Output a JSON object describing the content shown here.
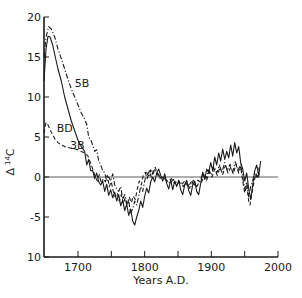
{
  "chart_data": {
    "type": "line",
    "title": "",
    "xlabel": "Years A.D.",
    "ylabel": "Δ 14C",
    "ylabel_parts": {
      "delta": "Δ",
      "mass": "14",
      "element": "C"
    },
    "xlim": [
      1649,
      2000
    ],
    "ylim": [
      -10,
      20
    ],
    "x_ticks": [
      1700,
      1800,
      1900,
      2000
    ],
    "x_minor_ticks": [
      1750,
      1850,
      1950
    ],
    "y_ticks": [
      20,
      15,
      10,
      5,
      0,
      -5,
      10
    ],
    "y_tick_values": [
      20,
      15,
      10,
      5,
      0,
      -5,
      -10
    ],
    "y_tick_labels": [
      "20",
      "15",
      "10",
      "5",
      "0",
      "-5",
      "10"
    ],
    "grid": false,
    "zero_line": true,
    "legend": "inline labels",
    "series": [
      {
        "name": "5B",
        "style": "dash-dot",
        "label_pos": {
          "x": 1695,
          "y": 11.2
        },
        "points": [
          [
            1649,
            15
          ],
          [
            1652,
            17.5
          ],
          [
            1656,
            18.8
          ],
          [
            1660,
            18.5
          ],
          [
            1665,
            17.5
          ],
          [
            1670,
            16
          ],
          [
            1675,
            14.8
          ],
          [
            1680,
            13.5
          ],
          [
            1685,
            12.2
          ],
          [
            1690,
            11
          ],
          [
            1695,
            10
          ],
          [
            1700,
            9
          ],
          [
            1705,
            8
          ],
          [
            1710,
            7.2
          ],
          [
            1713,
            6.6
          ],
          [
            1716,
            5
          ],
          [
            1720,
            4.5
          ],
          [
            1725,
            3.2
          ],
          [
            1728,
            3.4
          ],
          [
            1731,
            2
          ],
          [
            1734,
            1.5
          ],
          [
            1737,
            0.8
          ],
          [
            1740,
            0.5
          ],
          [
            1743,
            -0.5
          ],
          [
            1746,
            0
          ],
          [
            1749,
            -0.5
          ],
          [
            1752,
            0.4
          ],
          [
            1755,
            -1
          ],
          [
            1758,
            -1.5
          ],
          [
            1761,
            -1.8
          ],
          [
            1764,
            -1.2
          ],
          [
            1767,
            -2.8
          ],
          [
            1770,
            -2.2
          ],
          [
            1773,
            -3.5
          ],
          [
            1776,
            -3
          ],
          [
            1779,
            -4.5
          ],
          [
            1782,
            -4
          ],
          [
            1785,
            -3
          ],
          [
            1788,
            -3.5
          ],
          [
            1791,
            -2.4
          ],
          [
            1794,
            -1.2
          ],
          [
            1797,
            -1.8
          ],
          [
            1800,
            -0.5
          ],
          [
            1803,
            0.6
          ],
          [
            1806,
            0
          ],
          [
            1809,
            0.9
          ],
          [
            1812,
            0.2
          ],
          [
            1815,
            1
          ],
          [
            1818,
            0.6
          ],
          [
            1821,
            0.3
          ],
          [
            1824,
            -0.2
          ],
          [
            1828,
            0
          ],
          [
            1833,
            -0.4
          ],
          [
            1838,
            -0.8
          ],
          [
            1843,
            -0.3
          ],
          [
            1848,
            -1
          ],
          [
            1853,
            -0.5
          ],
          [
            1858,
            -1.2
          ],
          [
            1863,
            -0.6
          ],
          [
            1868,
            -1.5
          ],
          [
            1873,
            -0.4
          ],
          [
            1878,
            -1.2
          ],
          [
            1883,
            -0.5
          ],
          [
            1888,
            0.5
          ],
          [
            1892,
            -0.2
          ],
          [
            1896,
            0.9
          ],
          [
            1900,
            0.3
          ],
          [
            1904,
            1.3
          ],
          [
            1908,
            0.5
          ],
          [
            1912,
            1.5
          ],
          [
            1916,
            0.6
          ],
          [
            1920,
            1.8
          ],
          [
            1924,
            0.8
          ],
          [
            1928,
            1.6
          ],
          [
            1932,
            0.6
          ],
          [
            1936,
            1.9
          ],
          [
            1940,
            0.8
          ],
          [
            1944,
            1.6
          ],
          [
            1947,
            0
          ],
          [
            1950,
            -1.5
          ],
          [
            1953,
            -0.6
          ],
          [
            1956,
            -2.5
          ],
          [
            1959,
            -1.2
          ],
          [
            1962,
            -0.5
          ],
          [
            1965,
            0.5
          ],
          [
            1968,
            0
          ],
          [
            1972,
            1.2
          ]
        ]
      },
      {
        "name": "3B",
        "style": "solid",
        "label_pos": {
          "x": 1688,
          "y": 3.5
        },
        "points": [
          [
            1649,
            12
          ],
          [
            1652,
            16
          ],
          [
            1655,
            17.6
          ],
          [
            1658,
            17.5
          ],
          [
            1662,
            16.5
          ],
          [
            1666,
            15
          ],
          [
            1670,
            13.5
          ],
          [
            1675,
            12
          ],
          [
            1680,
            10
          ],
          [
            1685,
            8.5
          ],
          [
            1690,
            7
          ],
          [
            1695,
            5.8
          ],
          [
            1700,
            4.6
          ],
          [
            1705,
            3.8
          ],
          [
            1710,
            3.2
          ],
          [
            1713,
            1.5
          ],
          [
            1716,
            2.2
          ],
          [
            1719,
            0.8
          ],
          [
            1722,
            0.8
          ],
          [
            1725,
            -0.2
          ],
          [
            1728,
            0.5
          ],
          [
            1731,
            -0.6
          ],
          [
            1734,
            -1
          ],
          [
            1737,
            -0.5
          ],
          [
            1740,
            -1.8
          ],
          [
            1743,
            -0.9
          ],
          [
            1746,
            -2.3
          ],
          [
            1749,
            -1.6
          ],
          [
            1752,
            -2.6
          ],
          [
            1755,
            -1.9
          ],
          [
            1758,
            -3
          ],
          [
            1761,
            -2.2
          ],
          [
            1764,
            -3.6
          ],
          [
            1767,
            -2.9
          ],
          [
            1770,
            -4.2
          ],
          [
            1773,
            -3.4
          ],
          [
            1776,
            -4.8
          ],
          [
            1779,
            -4
          ],
          [
            1782,
            -5.5
          ],
          [
            1785,
            -6
          ],
          [
            1788,
            -5
          ],
          [
            1791,
            -4.2
          ],
          [
            1794,
            -3
          ],
          [
            1797,
            -3.8
          ],
          [
            1800,
            -2.4
          ],
          [
            1803,
            -1.4
          ],
          [
            1806,
            -2
          ],
          [
            1809,
            -0.6
          ],
          [
            1812,
            0
          ],
          [
            1815,
            -0.6
          ],
          [
            1818,
            0.5
          ],
          [
            1821,
            1
          ],
          [
            1824,
            0.2
          ],
          [
            1827,
            -0.5
          ],
          [
            1830,
            0.4
          ],
          [
            1833,
            -0.8
          ],
          [
            1836,
            -1.5
          ],
          [
            1839,
            -0.4
          ],
          [
            1842,
            -1.6
          ],
          [
            1845,
            -0.5
          ],
          [
            1848,
            -1.2
          ],
          [
            1851,
            -0.4
          ],
          [
            1854,
            -1.6
          ],
          [
            1857,
            -2.2
          ],
          [
            1860,
            -1
          ],
          [
            1863,
            -0.4
          ],
          [
            1866,
            -1.7
          ],
          [
            1869,
            -2.3
          ],
          [
            1872,
            -1
          ],
          [
            1875,
            -0.5
          ],
          [
            1878,
            -1.8
          ],
          [
            1881,
            -2.2
          ],
          [
            1884,
            -0.8
          ],
          [
            1887,
            0.6
          ],
          [
            1890,
            -0.3
          ],
          [
            1893,
            1
          ],
          [
            1896,
            0.5
          ],
          [
            1899,
            1.8
          ],
          [
            1902,
            0.8
          ],
          [
            1905,
            2.5
          ],
          [
            1908,
            1.5
          ],
          [
            1911,
            3
          ],
          [
            1914,
            2
          ],
          [
            1917,
            3.5
          ],
          [
            1920,
            2.2
          ],
          [
            1923,
            3.2
          ],
          [
            1926,
            2.4
          ],
          [
            1929,
            4
          ],
          [
            1932,
            2.6
          ],
          [
            1935,
            4.3
          ],
          [
            1938,
            3
          ],
          [
            1941,
            3.8
          ],
          [
            1944,
            1.8
          ],
          [
            1947,
            1
          ],
          [
            1950,
            -0.5
          ],
          [
            1953,
            0.5
          ],
          [
            1956,
            -1.5
          ],
          [
            1959,
            -2.8
          ],
          [
            1962,
            -1
          ],
          [
            1965,
            0.8
          ],
          [
            1968,
            1.5
          ],
          [
            1971,
            0.2
          ],
          [
            1974,
            2
          ]
        ]
      },
      {
        "name": "BD",
        "style": "dashed",
        "label_pos": {
          "x": 1668,
          "y": 5.6
        },
        "points": [
          [
            1649,
            5.5
          ],
          [
            1652,
            6.8
          ],
          [
            1655,
            6.5
          ],
          [
            1660,
            5.6
          ],
          [
            1665,
            4.8
          ],
          [
            1670,
            4.3
          ],
          [
            1675,
            4
          ],
          [
            1680,
            3.8
          ],
          [
            1685,
            3.7
          ],
          [
            1690,
            3.6
          ],
          [
            1695,
            3.5
          ],
          [
            1700,
            3.4
          ],
          [
            1705,
            3.2
          ],
          [
            1710,
            3
          ],
          [
            1715,
            2.6
          ],
          [
            1720,
            1.5
          ],
          [
            1723,
            0.8
          ],
          [
            1726,
            0
          ],
          [
            1729,
            -0.5
          ],
          [
            1732,
            0.3
          ],
          [
            1735,
            -0.8
          ],
          [
            1738,
            -0.2
          ],
          [
            1741,
            -0.6
          ],
          [
            1744,
            0.2
          ],
          [
            1747,
            -1.2
          ],
          [
            1750,
            -0.6
          ],
          [
            1753,
            -1.8
          ],
          [
            1756,
            -2.5
          ],
          [
            1759,
            -2
          ],
          [
            1762,
            -3
          ],
          [
            1765,
            -2.2
          ],
          [
            1768,
            -3.3
          ],
          [
            1771,
            -2.6
          ],
          [
            1774,
            -3.5
          ],
          [
            1777,
            -2.5
          ],
          [
            1780,
            -3.2
          ],
          [
            1783,
            -2.4
          ],
          [
            1786,
            -2.8
          ],
          [
            1789,
            -1.5
          ],
          [
            1792,
            -0.5
          ],
          [
            1795,
            -1
          ],
          [
            1798,
            0.2
          ],
          [
            1801,
            0.6
          ],
          [
            1804,
            -0.2
          ],
          [
            1807,
            0.8
          ],
          [
            1810,
            0
          ],
          [
            1813,
            0.8
          ],
          [
            1816,
            1.2
          ],
          [
            1819,
            0.4
          ],
          [
            1822,
            -0.2
          ],
          [
            1826,
            0
          ],
          [
            1830,
            -0.3
          ],
          [
            1835,
            -0.6
          ],
          [
            1840,
            -0.2
          ],
          [
            1845,
            -0.8
          ],
          [
            1850,
            -0.4
          ],
          [
            1855,
            -1
          ],
          [
            1860,
            -0.5
          ],
          [
            1865,
            -1.2
          ],
          [
            1870,
            -0.6
          ],
          [
            1875,
            -1
          ],
          [
            1880,
            -0.4
          ],
          [
            1885,
            -0.8
          ],
          [
            1889,
            0.2
          ],
          [
            1893,
            -0.4
          ],
          [
            1897,
            0.6
          ],
          [
            1901,
            0
          ],
          [
            1905,
            1
          ],
          [
            1909,
            0.2
          ],
          [
            1913,
            1.2
          ],
          [
            1917,
            0.3
          ],
          [
            1921,
            1.4
          ],
          [
            1925,
            0.5
          ],
          [
            1929,
            1.2
          ],
          [
            1933,
            0.4
          ],
          [
            1937,
            1.6
          ],
          [
            1941,
            0.5
          ],
          [
            1944,
            1.3
          ],
          [
            1947,
            -0.5
          ],
          [
            1950,
            -2
          ],
          [
            1953,
            -1
          ],
          [
            1956,
            -3
          ],
          [
            1958,
            -3.5
          ],
          [
            1961,
            -2
          ],
          [
            1964,
            -0.6
          ],
          [
            1967,
            0.4
          ],
          [
            1970,
            -0.2
          ],
          [
            1973,
            0.8
          ]
        ]
      }
    ]
  }
}
